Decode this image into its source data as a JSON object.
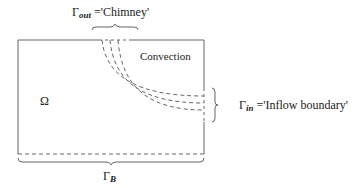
{
  "diagram": {
    "domain_label": "Ω",
    "region_label": "Convection",
    "boundaries": {
      "outflow": {
        "symbol": "Γ",
        "subscript": "out",
        "text": " ='Chimney'"
      },
      "inflow": {
        "symbol": "Γ",
        "subscript": "in",
        "text": " ='Inflow boundary'"
      },
      "bottom": {
        "symbol": "Γ",
        "subscript": "B"
      }
    },
    "colors": {
      "line": "#555555",
      "text": "#222222",
      "background": "#ffffff"
    }
  }
}
